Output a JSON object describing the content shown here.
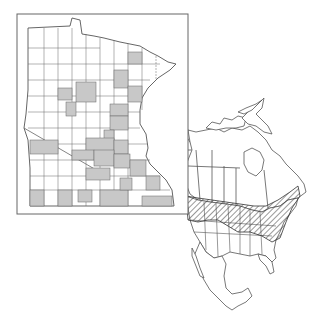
{
  "figure": {
    "type": "species-distribution-map",
    "background": "#ffffff",
    "line_color": "#555555",
    "fill_present": "#c8c8c8",
    "fill_absent": "#ffffff",
    "hatch_color": "#333333"
  },
  "inset": {
    "region": "Minnesota",
    "description": "County-level occurrence map; shaded counties indicate records",
    "frame": {
      "x": 17,
      "y": 14,
      "width": 171,
      "height": 200
    },
    "legend": {
      "shaded": "county with records",
      "unshaded": "no records"
    }
  },
  "range_map": {
    "region": "North America",
    "description": "Hatched band indicates species range across southern Canada and northern/central United States",
    "pattern": "diagonal-hatch"
  }
}
